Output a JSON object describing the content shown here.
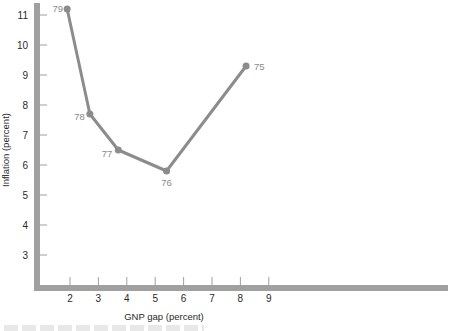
{
  "chart_data": {
    "type": "line",
    "title": "",
    "xlabel": "GNP gap (percent)",
    "ylabel": "Inflation (percent)",
    "x_ticks": [
      2,
      3,
      4,
      5,
      6,
      7,
      8,
      9
    ],
    "y_ticks": [
      3,
      4,
      5,
      6,
      7,
      8,
      9,
      10,
      11
    ],
    "xlim": [
      1,
      14
    ],
    "ylim": [
      2,
      11.3
    ],
    "grid": false,
    "legend": null,
    "series": [
      {
        "name": "Inflation vs GNP gap, 1975-1979",
        "points": [
          {
            "label": "79",
            "x": 1.9,
            "y": 11.2
          },
          {
            "label": "78",
            "x": 2.7,
            "y": 7.7
          },
          {
            "label": "77",
            "x": 3.7,
            "y": 6.5
          },
          {
            "label": "76",
            "x": 5.4,
            "y": 5.8
          },
          {
            "label": "75",
            "x": 8.2,
            "y": 9.3
          }
        ]
      }
    ]
  },
  "colors": {
    "axis": "#a0a0a0",
    "line": "#8c8c8c",
    "point_label": "#8a8a8a",
    "text": "#2a2a2a"
  }
}
